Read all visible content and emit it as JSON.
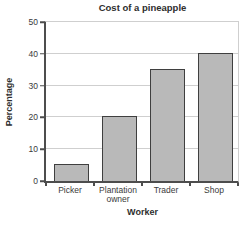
{
  "chart": {
    "title": "Cost of a pineapple",
    "xlabel": "Worker",
    "ylabel": "Percentage"
  },
  "chart_data": {
    "type": "bar",
    "title": "Cost of a pineapple",
    "xlabel": "Worker",
    "ylabel": "Percentage",
    "categories": [
      "Picker",
      "Plantation owner",
      "Trader",
      "Shop"
    ],
    "values": [
      5,
      20,
      35,
      40
    ],
    "ylim": [
      0,
      50
    ],
    "yticks": [
      0,
      10,
      20,
      30,
      40,
      50
    ],
    "grid": true,
    "legend": "none",
    "colors": {
      "bar_fill": "#b9b9b9",
      "bar_border": "#3f3f3f",
      "gridline": "#cfcfcf",
      "axis": "#4d4d4d",
      "text": "#3a3a3a",
      "background": "#ffffff"
    }
  }
}
